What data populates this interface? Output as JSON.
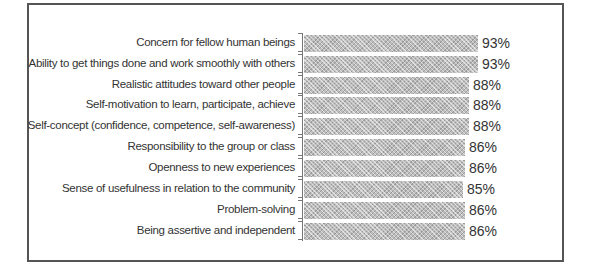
{
  "chart_data": {
    "type": "bar",
    "orientation": "horizontal",
    "title": "",
    "xlabel": "",
    "ylabel": "",
    "xlim": [
      0,
      100
    ],
    "grid": false,
    "legend": null,
    "categories": [
      "Concern for fellow human beings",
      "Ability to get things done and work smoothly with others",
      "Realistic attitudes toward other people",
      "Self-motivation to learn, participate, achieve",
      "Self-concept (confidence, competence, self-awareness)",
      "Responsibility to the group or class",
      "Openness to new experiences",
      "Sense of usefulness in relation to the community",
      "Problem-solving",
      "Being assertive and independent"
    ],
    "values": [
      93,
      93,
      88,
      88,
      88,
      86,
      86,
      85,
      86,
      86
    ],
    "value_labels": [
      "93%",
      "93%",
      "88%",
      "88%",
      "88%",
      "86%",
      "86%",
      "85%",
      "86%",
      "86%"
    ]
  },
  "rows": [
    {
      "label": "Concern for fellow human beings",
      "value": "93%"
    },
    {
      "label": "Ability to get things done and work smoothly with others",
      "value": "93%"
    },
    {
      "label": "Realistic attitudes toward other people",
      "value": "88%"
    },
    {
      "label": "Self-motivation to learn, participate, achieve",
      "value": "88%"
    },
    {
      "label": "Self-concept (confidence, competence, self-awareness)",
      "value": "88%"
    },
    {
      "label": "Responsibility to the group or class",
      "value": "86%"
    },
    {
      "label": "Openness to new experiences",
      "value": "86%"
    },
    {
      "label": "Sense of usefulness in relation to the community",
      "value": "85%"
    },
    {
      "label": "Problem-solving",
      "value": "86%"
    },
    {
      "label": "Being assertive and independent",
      "value": "86%"
    }
  ],
  "colors": {
    "bar": "#bdbdbd",
    "border": "#555555",
    "text": "#333333"
  }
}
